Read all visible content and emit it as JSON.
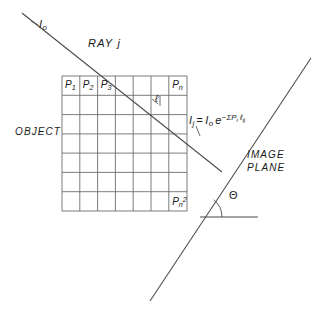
{
  "diagram": {
    "title_labels": {
      "ray": "RAY j",
      "incident_intensity": "I",
      "incident_intensity_sub": "o",
      "object": "OBJECT",
      "image_plane_line1": "IMAGE",
      "image_plane_line2": "PLANE",
      "angle": "Θ",
      "path_length": "ℓ"
    },
    "formula": {
      "lhs": "I",
      "lhs_sub": "j",
      "equals": "=",
      "i0": "I",
      "i0_sub": "o",
      "exp_base": "e",
      "exponent_minus": "−",
      "exponent_sum": "Σ",
      "exponent_p": "P",
      "exponent_p_sub": "i",
      "exponent_ell": "ℓ",
      "exponent_ell_sub": "ij",
      "full_text": "I_j = I_o e^(-ΣP_i ℓij)"
    },
    "grid": {
      "rows": 7,
      "cols": 7,
      "x": 62,
      "y": 76,
      "width": 125,
      "height": 135,
      "cell_labels": [
        {
          "text": "P",
          "sub": "1",
          "sup": "",
          "col": 0,
          "row": 0
        },
        {
          "text": "P",
          "sub": "2",
          "sup": "",
          "col": 1,
          "row": 0
        },
        {
          "text": "P",
          "sub": "3",
          "sup": "",
          "col": 2,
          "row": 0
        },
        {
          "text": "P",
          "sub": "n",
          "sup": "",
          "col": 6,
          "row": 0
        },
        {
          "text": "P",
          "sub": "n",
          "sup": "2",
          "col": 6,
          "row": 6
        }
      ],
      "stroke": "#6e6e6e"
    },
    "ray_line": {
      "x1": 22,
      "y1": 13,
      "x2": 222,
      "y2": 172,
      "stroke": "#4a4a4a"
    },
    "image_plane_line": {
      "x1": 311,
      "y1": 58,
      "x2": 150,
      "y2": 301,
      "stroke": "#4a4a4a"
    },
    "baseline": {
      "x1": 200,
      "y1": 217,
      "x2": 258,
      "y2": 217,
      "stroke": "#4a4a4a"
    },
    "angle_arc": {
      "center_x": 200,
      "center_y": 217,
      "radius": 22,
      "stroke": "#4a4a4a"
    },
    "colors": {
      "ink": "#1a1a1a",
      "line": "#4a4a4a",
      "grid": "#6e6e6e",
      "background": "#ffffff"
    }
  }
}
